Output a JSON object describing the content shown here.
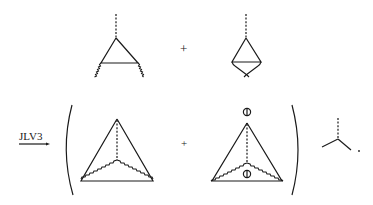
{
  "diagram": {
    "top_row": {
      "diagram_a": "vertex-correction-triangle-with-wavy-legs",
      "plus": "+",
      "diagram_b": "vertex-correction-with-crossed-wavy-legs"
    },
    "bottom_row": {
      "arrow_label": "JLV3",
      "open_paren": "(",
      "diagram_c": "tetrahedron-with-dashed-inner-and-wavy-lines",
      "plus": "+",
      "diagram_d": "tetrahedron-with-insertions",
      "insertion_symbol": "⦶",
      "close_paren": ")",
      "vertex": "three-point-vertex",
      "trailing": "."
    },
    "colors": {
      "ink": "#1a1a1a",
      "background": "#ffffff"
    }
  }
}
